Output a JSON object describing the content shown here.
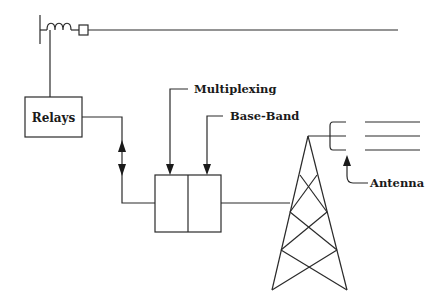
{
  "diagram": {
    "type": "power line carrier communication schematic",
    "labels": {
      "relays": "Relays",
      "multiplexing": "Multiplexing",
      "base_band": "Base-Band",
      "antenna": "Antenna"
    },
    "nodes": [
      {
        "id": "bus-bar",
        "kind": "vertical bus bar"
      },
      {
        "id": "line-trap-coil",
        "kind": "inductor coil"
      },
      {
        "id": "coupling-square",
        "kind": "small square element"
      },
      {
        "id": "transmission-line",
        "kind": "horizontal line"
      },
      {
        "id": "relays-box",
        "label_ref": "relays"
      },
      {
        "id": "multiplexing-baseband-unit",
        "kind": "two-cell box"
      },
      {
        "id": "tower",
        "kind": "lattice tower"
      },
      {
        "id": "antenna-dish",
        "kind": "horn antenna with feed lines"
      }
    ],
    "connections": [
      {
        "from": "bus-bar",
        "to": "relays-box"
      },
      {
        "from": "relays-box",
        "to": "multiplexing-baseband-unit",
        "arrow": "bidirectional"
      },
      {
        "from": "multiplexing-baseband-unit",
        "to": "tower"
      },
      {
        "from": "tower",
        "to": "antenna-dish"
      }
    ],
    "colors": {
      "stroke": "#2a2a2a",
      "background": "#ffffff"
    }
  }
}
